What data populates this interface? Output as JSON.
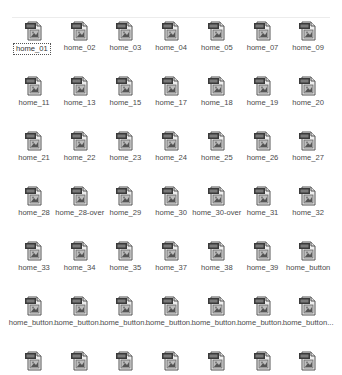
{
  "view": {
    "layout": "icon-grid",
    "columns": 7,
    "selected_index": 0,
    "icon_type": "image-file-icon",
    "colors": {
      "background": "#ffffff",
      "label": "#4a4a4a",
      "divider": "#ececec"
    }
  },
  "files": [
    {
      "name": "home_01"
    },
    {
      "name": "home_02"
    },
    {
      "name": "home_03"
    },
    {
      "name": "home_04"
    },
    {
      "name": "home_05"
    },
    {
      "name": "home_07"
    },
    {
      "name": "home_09"
    },
    {
      "name": "home_11"
    },
    {
      "name": "home_13"
    },
    {
      "name": "home_15"
    },
    {
      "name": "home_17"
    },
    {
      "name": "home_18"
    },
    {
      "name": "home_19"
    },
    {
      "name": "home_20"
    },
    {
      "name": "home_21"
    },
    {
      "name": "home_22"
    },
    {
      "name": "home_23"
    },
    {
      "name": "home_24"
    },
    {
      "name": "home_25"
    },
    {
      "name": "home_26"
    },
    {
      "name": "home_27"
    },
    {
      "name": "home_28"
    },
    {
      "name": "home_28-over"
    },
    {
      "name": "home_29"
    },
    {
      "name": "home_30"
    },
    {
      "name": "home_30-over"
    },
    {
      "name": "home_31"
    },
    {
      "name": "home_32"
    },
    {
      "name": "home_33"
    },
    {
      "name": "home_34"
    },
    {
      "name": "home_35"
    },
    {
      "name": "home_37"
    },
    {
      "name": "home_38"
    },
    {
      "name": "home_39"
    },
    {
      "name": "home_button"
    },
    {
      "name": "home_button..."
    },
    {
      "name": "home_button..."
    },
    {
      "name": "home_button..."
    },
    {
      "name": "home_button..."
    },
    {
      "name": "home_button..."
    },
    {
      "name": "home_button..."
    },
    {
      "name": "home_button..."
    },
    {
      "name": ""
    },
    {
      "name": ""
    },
    {
      "name": ""
    },
    {
      "name": ""
    },
    {
      "name": ""
    },
    {
      "name": ""
    },
    {
      "name": ""
    }
  ]
}
